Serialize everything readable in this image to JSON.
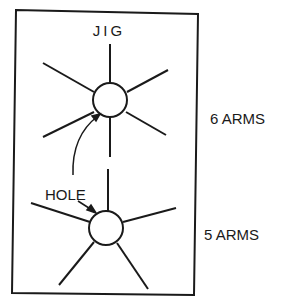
{
  "diagram": {
    "title": "JIG",
    "hole_label": "HOLE",
    "stars": [
      {
        "label": "6 ARMS",
        "arms": 6
      },
      {
        "label": "5 ARMS",
        "arms": 5
      }
    ],
    "colors": {
      "ink": "#1a1a1a",
      "background": "#ffffff"
    }
  }
}
